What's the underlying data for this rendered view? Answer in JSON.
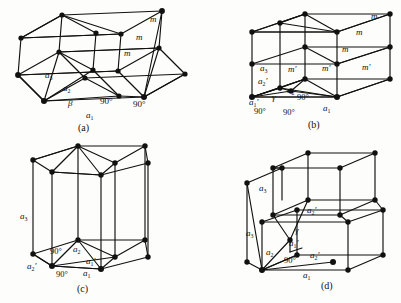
{
  "figure": {
    "background_color": "#fdfdfb",
    "ink_color": "#111111",
    "panels": [
      {
        "id": "a",
        "caption": "(a)",
        "labels": [
          {
            "text": "m",
            "x": 150,
            "y": 21
          },
          {
            "text": "m",
            "x": 136,
            "y": 39
          },
          {
            "text": "m",
            "x": 124,
            "y": 55
          },
          {
            "text": "a3",
            "x": 45,
            "y": 77
          },
          {
            "text": "a2",
            "x": 63,
            "y": 90
          },
          {
            "text": "β",
            "x": 68,
            "y": 105
          },
          {
            "text": "90°",
            "x": 103,
            "y": 103
          },
          {
            "text": "90°",
            "x": 135,
            "y": 106
          },
          {
            "text": "a1",
            "x": 87,
            "y": 117
          }
        ]
      },
      {
        "id": "b",
        "caption": "(b)",
        "labels": [
          {
            "text": "m",
            "x": 372,
            "y": 18
          },
          {
            "text": "m",
            "x": 357,
            "y": 34
          },
          {
            "text": "m",
            "x": 343,
            "y": 51
          },
          {
            "text": "m'",
            "x": 290,
            "y": 71
          },
          {
            "text": "m'",
            "x": 324,
            "y": 70
          },
          {
            "text": "m'",
            "x": 364,
            "y": 69
          },
          {
            "text": "a3",
            "x": 272,
            "y": 70
          },
          {
            "text": "a2'",
            "x": 268,
            "y": 83
          },
          {
            "text": "a2",
            "x": 289,
            "y": 92
          },
          {
            "text": "γ",
            "x": 276,
            "y": 100
          },
          {
            "text": "a1'",
            "x": 260,
            "y": 104
          },
          {
            "text": "90°",
            "x": 300,
            "y": 99
          },
          {
            "text": "90°",
            "x": 263,
            "y": 113
          },
          {
            "text": "90°",
            "x": 290,
            "y": 114
          },
          {
            "text": "a1",
            "x": 325,
            "y": 110
          }
        ]
      },
      {
        "id": "c",
        "caption": "(c)",
        "labels": [
          {
            "text": "a3",
            "x": 25,
            "y": 218
          },
          {
            "text": "90°",
            "x": 54,
            "y": 254
          },
          {
            "text": "a2",
            "x": 74,
            "y": 252
          },
          {
            "text": "a1'",
            "x": 85,
            "y": 264
          },
          {
            "text": "a2'",
            "x": 33,
            "y": 268
          },
          {
            "text": "90°",
            "x": 60,
            "y": 275
          },
          {
            "text": "a1",
            "x": 84,
            "y": 274
          }
        ]
      },
      {
        "id": "d",
        "caption": "(d)",
        "labels": [
          {
            "text": "a3",
            "x": 264,
            "y": 190
          },
          {
            "text": "a2'",
            "x": 310,
            "y": 212
          },
          {
            "text": "γ",
            "x": 297,
            "y": 232
          },
          {
            "text": "a3",
            "x": 251,
            "y": 235
          },
          {
            "text": "a1'",
            "x": 292,
            "y": 245
          },
          {
            "text": "a2",
            "x": 270,
            "y": 254
          },
          {
            "text": "90°",
            "x": 288,
            "y": 262
          },
          {
            "text": "a2'",
            "x": 312,
            "y": 257
          },
          {
            "text": "a1",
            "x": 305,
            "y": 277
          }
        ]
      }
    ],
    "captions": [
      {
        "text": "(a)",
        "x": 81,
        "y": 128
      },
      {
        "text": "(b)",
        "x": 310,
        "y": 125
      },
      {
        "text": "(c)",
        "x": 80,
        "y": 288
      },
      {
        "text": "(d)",
        "x": 323,
        "y": 285
      }
    ]
  }
}
